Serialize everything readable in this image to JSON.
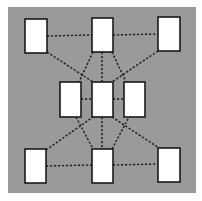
{
  "diagram": {
    "background": "#9a9a9a",
    "node_fill": "#ffffff",
    "node_stroke": "#1a1a1a",
    "edge_color": "#1a1a1a",
    "panel": {
      "x": 8,
      "y": 7,
      "w": 188,
      "h": 186
    },
    "nodes": [
      {
        "id": "top-left",
        "x": 25,
        "y": 19,
        "w": 22,
        "h": 34
      },
      {
        "id": "top-center",
        "x": 92,
        "y": 18,
        "w": 21,
        "h": 34
      },
      {
        "id": "top-right",
        "x": 158,
        "y": 17,
        "w": 22,
        "h": 34
      },
      {
        "id": "middle-left",
        "x": 60,
        "y": 82,
        "w": 21,
        "h": 35
      },
      {
        "id": "middle-center",
        "x": 92,
        "y": 82,
        "w": 21,
        "h": 35
      },
      {
        "id": "middle-right",
        "x": 124,
        "y": 82,
        "w": 21,
        "h": 35
      },
      {
        "id": "bottom-left",
        "x": 25,
        "y": 149,
        "w": 21,
        "h": 34
      },
      {
        "id": "bottom-center",
        "x": 92,
        "y": 149,
        "w": 21,
        "h": 34
      },
      {
        "id": "bottom-right",
        "x": 158,
        "y": 148,
        "w": 22,
        "h": 34
      }
    ],
    "edges": [
      {
        "from": "top-left",
        "to": "top-center",
        "x1": 47,
        "y1": 36,
        "x2": 92,
        "y2": 35
      },
      {
        "from": "top-center",
        "to": "top-right",
        "x1": 113,
        "y1": 35,
        "x2": 158,
        "y2": 34
      },
      {
        "from": "top-left",
        "to": "middle-center",
        "x1": 47,
        "y1": 52,
        "x2": 93,
        "y2": 82
      },
      {
        "from": "top-center",
        "to": "middle-left",
        "x1": 93,
        "y1": 52,
        "x2": 79,
        "y2": 82
      },
      {
        "from": "top-center",
        "to": "middle-center",
        "x1": 102,
        "y1": 52,
        "x2": 102,
        "y2": 82
      },
      {
        "from": "top-center",
        "to": "middle-right",
        "x1": 112,
        "y1": 52,
        "x2": 126,
        "y2": 82
      },
      {
        "from": "top-right",
        "to": "middle-center",
        "x1": 158,
        "y1": 51,
        "x2": 112,
        "y2": 82
      },
      {
        "from": "middle-left",
        "to": "middle-center",
        "x1": 81,
        "y1": 99,
        "x2": 92,
        "y2": 99
      },
      {
        "from": "middle-center",
        "to": "middle-right",
        "x1": 113,
        "y1": 99,
        "x2": 124,
        "y2": 99
      },
      {
        "from": "middle-left",
        "to": "bottom-center",
        "x1": 76,
        "y1": 117,
        "x2": 93,
        "y2": 149
      },
      {
        "from": "bottom-left",
        "to": "middle-center",
        "x1": 46,
        "y1": 150,
        "x2": 93,
        "y2": 117
      },
      {
        "from": "middle-center",
        "to": "bottom-center",
        "x1": 102,
        "y1": 117,
        "x2": 102,
        "y2": 149
      },
      {
        "from": "middle-center",
        "to": "bottom-right",
        "x1": 112,
        "y1": 117,
        "x2": 159,
        "y2": 148
      },
      {
        "from": "bottom-center",
        "to": "middle-right",
        "x1": 112,
        "y1": 149,
        "x2": 129,
        "y2": 117
      },
      {
        "from": "bottom-left",
        "to": "bottom-center",
        "x1": 46,
        "y1": 166,
        "x2": 92,
        "y2": 165
      },
      {
        "from": "bottom-center",
        "to": "bottom-right",
        "x1": 113,
        "y1": 165,
        "x2": 158,
        "y2": 164
      }
    ]
  }
}
